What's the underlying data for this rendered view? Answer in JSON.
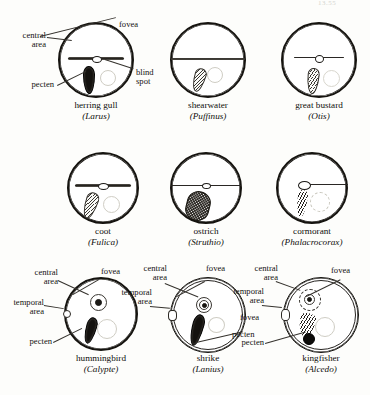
{
  "header": {
    "fragment": "13.55"
  },
  "figure": {
    "rows": 3,
    "columns": 3
  },
  "label_terms": {
    "central_area": "central\narea",
    "fovea": "fovea",
    "pecten": "pecten",
    "blind_spot": "blind\nspot",
    "temporal_area": "temporal\narea"
  },
  "panels": [
    {
      "id": "herring-gull",
      "common_name": "herring gull",
      "genus": "(Larus)",
      "row": 1,
      "column": 1,
      "labels": [
        "central\narea",
        "fovea",
        "pecten",
        "blind\nspot"
      ],
      "features": {
        "central_area_band": "wide horizontal streak",
        "fovea": "small ellipse mid-band",
        "pecten": "dark elongated vertical",
        "blind_spot": "faint pale circle right of pecten"
      }
    },
    {
      "id": "shearwater",
      "common_name": "shearwater",
      "genus": "(Puffinus)",
      "row": 1,
      "column": 2,
      "labels": [],
      "features": {
        "central_area_band": "full-width horizontal streak",
        "fovea": "none visible",
        "pecten": "small hatched oblique",
        "blind_spot": "faint pale circle"
      }
    },
    {
      "id": "great-bustard",
      "common_name": "great bustard",
      "genus": "(Otis)",
      "row": 1,
      "column": 3,
      "labels": [],
      "features": {
        "central_area_band": "thin horizontal streak",
        "fovea": "small circle mid-band",
        "pecten": "hatched oblique",
        "blind_spot": "faint pale circle"
      }
    },
    {
      "id": "coot",
      "common_name": "coot",
      "genus": "(Fulica)",
      "row": 2,
      "column": 1,
      "labels": [],
      "features": {
        "central_area_band": "wide horizontal streak",
        "fovea": "small ellipse mid-band",
        "pecten": "hatched oblique tapering",
        "blind_spot": "faint pale circle"
      }
    },
    {
      "id": "ostrich",
      "common_name": "ostrich",
      "genus": "(Struthio)",
      "row": 2,
      "column": 2,
      "labels": [],
      "features": {
        "central_area_band": "full-width thin streak",
        "fovea": "tiny ellipse mid-band",
        "pecten": "large dense stippled oval",
        "blind_spot": "obscured by pecten"
      }
    },
    {
      "id": "cormorant",
      "common_name": "cormorant",
      "genus": "(Phalacrocorax)",
      "row": 2,
      "column": 3,
      "labels": [],
      "features": {
        "central_area_band": "narrow streak, fovea at left end",
        "fovea": "spoon-shaped at band end",
        "pecten": "narrow dark hatched vertical",
        "blind_spot": "dashed pale circle"
      }
    },
    {
      "id": "hummingbird",
      "common_name": "hummingbird",
      "genus": "(Calypte)",
      "row": 3,
      "column": 1,
      "labels": [
        "central\narea",
        "fovea",
        "temporal\narea",
        "pecten"
      ],
      "features": {
        "central_area_band": "none; small round central area",
        "fovea": "small dot inside central area",
        "pecten": "dark narrow oblique",
        "blind_spot": "faint pale circle",
        "temporal_area": "bump on nasal rim"
      }
    },
    {
      "id": "shrike",
      "common_name": "shrike",
      "genus": "(Lanius)",
      "row": 3,
      "column": 2,
      "labels": [
        "central\narea",
        "fovea",
        "temporal\narea",
        "pecten"
      ],
      "features": {
        "central_area_band": "small round central area",
        "fovea": "concentric rings",
        "pecten": "dark elongated oblique",
        "blind_spot": "faint pale circle",
        "temporal_area": "notch on rim with its own fovea"
      }
    },
    {
      "id": "kingfisher",
      "common_name": "kingfisher",
      "genus": "(Alcedo)",
      "row": 3,
      "column": 3,
      "labels": [
        "central\narea",
        "fovea",
        "temporal\narea",
        "pecten"
      ],
      "features": {
        "central_area_band": "small round central area upper left",
        "fovea": "ringed dot in central area",
        "pecten": "feathered plume with dark bulb",
        "blind_spot": "faint pale circle",
        "temporal_area": "notch on rim with its own fovea"
      }
    }
  ],
  "colors": {
    "ink": "#15130f",
    "paper": "#fdfdfb",
    "faint": "#cfcdc4",
    "mid": "#35322d"
  }
}
